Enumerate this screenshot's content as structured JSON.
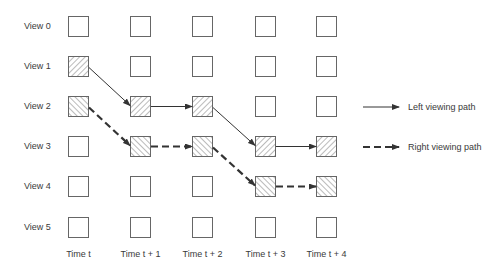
{
  "diagram": {
    "view_labels": [
      "View 0",
      "View 1",
      "View 2",
      "View 3",
      "View 4",
      "View 5"
    ],
    "time_labels": [
      "Time t",
      "Time t + 1",
      "Time t + 2",
      "Time t + 3",
      "Time t + 4"
    ],
    "legend": {
      "left": "Left viewing path",
      "right": "Right viewing path"
    },
    "left_path": [
      [
        0,
        1
      ],
      [
        1,
        2
      ],
      [
        2,
        2
      ],
      [
        3,
        3
      ],
      [
        4,
        3
      ]
    ],
    "right_path": [
      [
        0,
        2
      ],
      [
        1,
        3
      ],
      [
        2,
        3
      ],
      [
        3,
        4
      ],
      [
        4,
        4
      ]
    ]
  }
}
